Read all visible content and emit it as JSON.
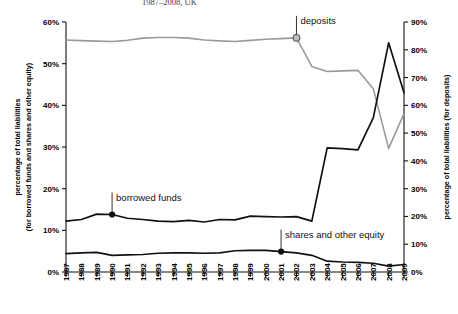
{
  "subtitle": "1987–2008, UK",
  "chart_data": {
    "type": "line",
    "title": "1987–2008, UK",
    "xlabel": "",
    "ylabel": "percentage of total liabilities (for borrowed funds and shares and other equity)",
    "ylabel_right": "percentage of total liabilities (for deposits)",
    "grid": false,
    "legend_position": "inline-annotations",
    "ylim": [
      0,
      60
    ],
    "ylim_right": [
      0,
      90
    ],
    "yticks": [
      "0%",
      "10%",
      "20%",
      "30%",
      "40%",
      "50%",
      "60%"
    ],
    "yticks_right": [
      "0%",
      "10%",
      "20%",
      "30%",
      "40%",
      "50%",
      "60%",
      "70%",
      "80%",
      "90%"
    ],
    "categories": [
      "1987",
      "1988",
      "1989",
      "1990",
      "1991",
      "1992",
      "1993",
      "1994",
      "1995",
      "1996",
      "1997",
      "1998",
      "1999",
      "2000",
      "2001",
      "2002",
      "2003",
      "2004",
      "2005",
      "2006",
      "2007",
      "2008",
      "2009"
    ],
    "series": [
      {
        "name": "deposits",
        "axis": "right",
        "color": "#9a9a9a",
        "values": [
          83.5,
          83.3,
          83.1,
          83.0,
          83.4,
          84.2,
          84.4,
          84.4,
          84.2,
          83.5,
          83.2,
          83.0,
          83.4,
          83.8,
          84.0,
          84.3,
          74.0,
          72.2,
          72.4,
          72.6,
          66.0,
          44.5,
          57.0
        ]
      },
      {
        "name": "borrowed funds",
        "axis": "left",
        "color": "#111111",
        "values": [
          12.2,
          12.6,
          13.9,
          13.8,
          12.9,
          12.6,
          12.2,
          12.1,
          12.4,
          12.0,
          12.6,
          12.5,
          13.4,
          13.3,
          13.2,
          13.3,
          12.2,
          29.8,
          29.6,
          29.3,
          37.0,
          55.0,
          43.0
        ]
      },
      {
        "name": "shares and other equity",
        "axis": "left",
        "color": "#111111",
        "values": [
          4.4,
          4.6,
          4.7,
          4.0,
          4.1,
          4.2,
          4.5,
          4.6,
          4.6,
          4.5,
          4.6,
          5.1,
          5.2,
          5.2,
          4.9,
          4.6,
          4.0,
          2.6,
          2.4,
          2.3,
          2.1,
          1.4,
          1.8
        ]
      }
    ],
    "annotations": [
      {
        "label": "deposits",
        "year": "2002",
        "marker": "open-circle"
      },
      {
        "label": "borrowed funds",
        "year": "1990",
        "marker": "filled-circle"
      },
      {
        "label": "shares and other equity",
        "year": "2001",
        "marker": "filled-circle"
      }
    ]
  }
}
